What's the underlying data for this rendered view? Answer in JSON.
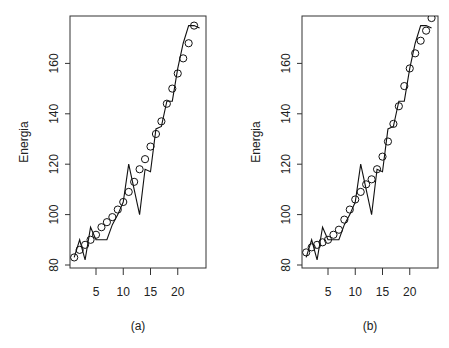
{
  "chart_data": [
    {
      "type": "line",
      "panel_label": "(a)",
      "ylabel": "Energia",
      "xlabel": "",
      "xlim": [
        0.5,
        24.5
      ],
      "ylim": [
        79,
        179
      ],
      "x_ticks": [
        5,
        10,
        15,
        20
      ],
      "y_ticks": [
        80,
        100,
        120,
        140,
        160
      ],
      "grid": false,
      "x": [
        1,
        2,
        3,
        4,
        5,
        6,
        7,
        8,
        9,
        10,
        11,
        12,
        13,
        14,
        15,
        16,
        17,
        18,
        19,
        20,
        21,
        22,
        23,
        24
      ],
      "series": [
        {
          "name": "observed",
          "style": "line",
          "values": [
            83,
            90,
            82,
            95,
            90,
            90,
            90,
            96,
            100,
            105,
            120,
            110,
            100,
            118,
            117,
            134,
            135,
            145,
            145,
            158,
            168,
            175,
            175,
            174
          ]
        },
        {
          "name": "fitted",
          "style": "points-circle",
          "values": [
            83,
            86,
            88,
            90,
            92,
            95,
            97,
            99,
            102,
            105,
            109,
            113,
            118,
            122,
            127,
            132,
            137,
            144,
            150,
            156,
            162,
            168,
            175,
            null
          ]
        }
      ]
    },
    {
      "type": "line",
      "panel_label": "(b)",
      "ylabel": "Energia",
      "xlabel": "",
      "xlim": [
        0.5,
        24.5
      ],
      "ylim": [
        79,
        179
      ],
      "x_ticks": [
        5,
        10,
        15,
        20
      ],
      "y_ticks": [
        80,
        100,
        120,
        140,
        160
      ],
      "grid": false,
      "x": [
        1,
        2,
        3,
        4,
        5,
        6,
        7,
        8,
        9,
        10,
        11,
        12,
        13,
        14,
        15,
        16,
        17,
        18,
        19,
        20,
        21,
        22,
        23,
        24
      ],
      "series": [
        {
          "name": "observed",
          "style": "line",
          "values": [
            83,
            90,
            82,
            95,
            90,
            90,
            90,
            96,
            100,
            105,
            120,
            110,
            100,
            118,
            117,
            134,
            135,
            145,
            145,
            158,
            168,
            175,
            175,
            174
          ]
        },
        {
          "name": "fitted",
          "style": "points-circle",
          "values": [
            85,
            87,
            88,
            89,
            90,
            92,
            94,
            98,
            102,
            106,
            109,
            112,
            114,
            118,
            123,
            129,
            136,
            143,
            151,
            158,
            164,
            169,
            173,
            178
          ]
        }
      ]
    }
  ],
  "panels": [
    {
      "label": "(a)",
      "ylabel": "Energia"
    },
    {
      "label": "(b)",
      "ylabel": "Energia"
    }
  ]
}
